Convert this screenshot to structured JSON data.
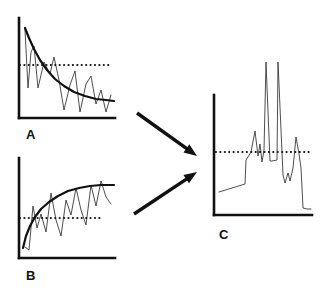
{
  "figure": {
    "background_color": "#ffffff",
    "ink_color": "#111111",
    "axis_color": "#111111",
    "curve_color": "#111111",
    "series_color": "#444444",
    "dotted_line_color": "#111111",
    "arrow_color": "#111111"
  },
  "panels": [
    {
      "id": "A",
      "label": "A",
      "label_position": {
        "x": 26,
        "y": 128
      },
      "axes": {
        "x_axis": {
          "x1": 19,
          "y1": 118,
          "x2": 115,
          "y2": 118
        },
        "y_axis": {
          "x1": 19,
          "y1": 18,
          "x2": 19,
          "y2": 118
        },
        "line_width": 2.6
      },
      "threshold_line": {
        "y": 65,
        "x_start": 20,
        "x_end": 112,
        "style": "dotted",
        "dot_size": 2.2,
        "dot_gap": 4.4
      },
      "trend_curve": {
        "shape": "exponential-decay",
        "points": [
          [
            25,
            28
          ],
          [
            29,
            38
          ],
          [
            34,
            49
          ],
          [
            40,
            60
          ],
          [
            47,
            70
          ],
          [
            55,
            79
          ],
          [
            64,
            86
          ],
          [
            74,
            92
          ],
          [
            85,
            96
          ],
          [
            96,
            99
          ],
          [
            106,
            100
          ],
          [
            114,
            101
          ]
        ],
        "line_width": 2.2
      },
      "noisy_series": {
        "points": [
          [
            25,
            30
          ],
          [
            28,
            88
          ],
          [
            31,
            52
          ],
          [
            34,
            46
          ],
          [
            38,
            88
          ],
          [
            44,
            62
          ],
          [
            50,
            74
          ],
          [
            54,
            57
          ],
          [
            59,
            80
          ],
          [
            64,
            110
          ],
          [
            70,
            85
          ],
          [
            75,
            71
          ],
          [
            80,
            112
          ],
          [
            86,
            84
          ],
          [
            91,
            76
          ],
          [
            96,
            104
          ],
          [
            101,
            90
          ],
          [
            106,
            112
          ],
          [
            111,
            95
          ]
        ],
        "line_width": 0.9
      }
    },
    {
      "id": "B",
      "label": "B",
      "label_position": {
        "x": 26,
        "y": 269
      },
      "axes": {
        "x_axis": {
          "x1": 19,
          "y1": 258,
          "x2": 115,
          "y2": 258
        },
        "y_axis": {
          "x1": 19,
          "y1": 158,
          "x2": 19,
          "y2": 258
        },
        "line_width": 2.6
      },
      "threshold_line": {
        "y": 218,
        "x_start": 20,
        "x_end": 103,
        "style": "dotted",
        "dot_size": 2.2,
        "dot_gap": 4.4
      },
      "trend_curve": {
        "shape": "saturating-growth",
        "points": [
          [
            23,
            248
          ],
          [
            26,
            236
          ],
          [
            30,
            226
          ],
          [
            35,
            217
          ],
          [
            41,
            209
          ],
          [
            49,
            202
          ],
          [
            58,
            196
          ],
          [
            68,
            191
          ],
          [
            79,
            188
          ],
          [
            90,
            186
          ],
          [
            101,
            185
          ],
          [
            114,
            185
          ]
        ],
        "line_width": 2.2
      },
      "noisy_series": {
        "points": [
          [
            25,
            247
          ],
          [
            29,
            250
          ],
          [
            33,
            206
          ],
          [
            37,
            228
          ],
          [
            41,
            214
          ],
          [
            46,
            232
          ],
          [
            51,
            193
          ],
          [
            56,
            220
          ],
          [
            61,
            236
          ],
          [
            66,
            200
          ],
          [
            71,
            215
          ],
          [
            76,
            188
          ],
          [
            81,
            210
          ],
          [
            86,
            225
          ],
          [
            91,
            185
          ],
          [
            96,
            206
          ],
          [
            101,
            181
          ],
          [
            106,
            197
          ],
          [
            111,
            204
          ]
        ],
        "line_width": 0.9
      }
    },
    {
      "id": "C",
      "label": "C",
      "label_position": {
        "x": 219,
        "y": 228
      },
      "axes": {
        "x_axis": {
          "x1": 214,
          "y1": 215,
          "x2": 312,
          "y2": 215
        },
        "y_axis": {
          "x1": 214,
          "y1": 95,
          "x2": 214,
          "y2": 215
        },
        "line_width": 2.6
      },
      "threshold_line": {
        "y": 152,
        "x_start": 216,
        "x_end": 312,
        "style": "dotted",
        "dot_size": 2.2,
        "dot_gap": 4.4
      },
      "noisy_series": {
        "points": [
          [
            219,
            192
          ],
          [
            232,
            188
          ],
          [
            245,
            184
          ],
          [
            246,
            160
          ],
          [
            251,
            152
          ],
          [
            255,
            131
          ],
          [
            258,
            156
          ],
          [
            260,
            144
          ],
          [
            262,
            162
          ],
          [
            264,
            150
          ],
          [
            266,
            62
          ],
          [
            270,
            161
          ],
          [
            272,
            161
          ],
          [
            277,
            160
          ],
          [
            278,
            62
          ],
          [
            283,
            175
          ],
          [
            285,
            183
          ],
          [
            288,
            173
          ],
          [
            290,
            181
          ],
          [
            293,
            168
          ],
          [
            296,
            137
          ],
          [
            299,
            154
          ],
          [
            301,
            168
          ],
          [
            303,
            208
          ],
          [
            307,
            209
          ],
          [
            311,
            209
          ]
        ],
        "line_width": 0.9
      }
    }
  ],
  "arrows": [
    {
      "name": "arrow-a-to-c",
      "from": {
        "x": 137,
        "y": 113
      },
      "to": {
        "x": 197,
        "y": 156
      },
      "line_width": 3.4,
      "head_length": 13,
      "head_width": 10
    },
    {
      "name": "arrow-b-to-c",
      "from": {
        "x": 134,
        "y": 214
      },
      "to": {
        "x": 197,
        "y": 172
      },
      "line_width": 3.4,
      "head_length": 13,
      "head_width": 10
    }
  ]
}
